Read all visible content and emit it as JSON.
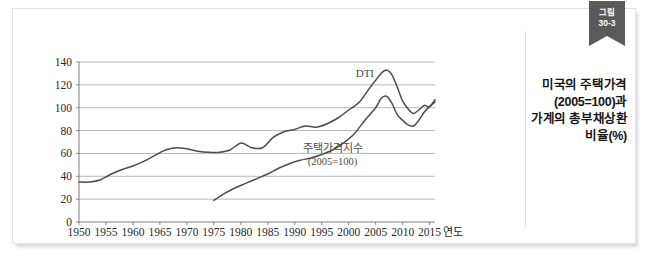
{
  "figure": {
    "ribbon": {
      "label_top": "그림",
      "label_bottom": "30-3"
    },
    "title_lines": [
      "미국의 주택가격",
      "(2005=100)과",
      "가계의 총부채상환",
      "비율(%)"
    ],
    "accent_color": "#5a5a5a",
    "line_color": "#4d4d4d",
    "grid_color": "#9a9a9a"
  },
  "chart_data": {
    "type": "line",
    "xlabel": "연도",
    "ylabel": "",
    "xlim": [
      1950,
      2016
    ],
    "ylim": [
      0,
      140
    ],
    "grid": true,
    "legend": "inline-annotation",
    "y_ticks": [
      0,
      20,
      40,
      60,
      80,
      100,
      120,
      140
    ],
    "x_ticks": [
      1950,
      1955,
      1960,
      1965,
      1970,
      1975,
      1980,
      1985,
      1990,
      1995,
      2000,
      2005,
      2010,
      2015
    ],
    "x_axis_unit": "연도",
    "series": [
      {
        "name": "DTI",
        "annotation_label": "DTI",
        "annotation_x": 2003,
        "annotation_y": 127,
        "x": [
          1950,
          1952,
          1954,
          1956,
          1958,
          1960,
          1962,
          1964,
          1966,
          1968,
          1970,
          1972,
          1974,
          1976,
          1978,
          1980,
          1982,
          1984,
          1986,
          1988,
          1990,
          1992,
          1994,
          1996,
          1998,
          2000,
          2002,
          2004,
          2005,
          2006,
          2007,
          2008,
          2009,
          2010,
          2011,
          2012,
          2013,
          2014,
          2015,
          2016
        ],
        "values": [
          35,
          35,
          37,
          42,
          46,
          49,
          53,
          58,
          63,
          65,
          64,
          62,
          61,
          61,
          63,
          69,
          65,
          65,
          74,
          79,
          81,
          84,
          83,
          86,
          91,
          98,
          105,
          118,
          124,
          130,
          133,
          129,
          118,
          106,
          99,
          95,
          98,
          102,
          101,
          107
        ]
      },
      {
        "name": "주택가격지수 (2005=100)",
        "annotation_label": "주택가격지수",
        "annotation_label2": "(2005=100)",
        "annotation_x": 1997,
        "annotation_y": 61,
        "x": [
          1975,
          1977,
          1979,
          1981,
          1983,
          1985,
          1987,
          1989,
          1991,
          1993,
          1995,
          1997,
          1999,
          2001,
          2003,
          2005,
          2006,
          2007,
          2008,
          2009,
          2010,
          2011,
          2012,
          2013,
          2014,
          2015,
          2016
        ],
        "values": [
          19,
          25,
          30,
          34,
          38,
          42,
          47,
          51,
          54,
          56,
          59,
          63,
          69,
          77,
          89,
          100,
          108,
          110,
          104,
          94,
          89,
          85,
          84,
          89,
          96,
          101,
          105
        ]
      }
    ]
  }
}
